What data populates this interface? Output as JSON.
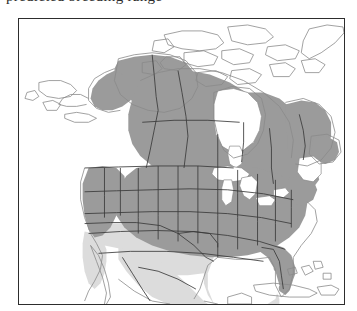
{
  "figure": {
    "title_partial": "predicted breeding range",
    "frame_color": "#2d2d2d",
    "background": "#ffffff"
  },
  "map": {
    "name": "north-america-distribution-map",
    "projection_hint": "lambert-conformal-conic",
    "outline_color": "#8a8a8a",
    "border_color": "#3a3a3a",
    "water_color": "#ffffff",
    "regions": [
      {
        "id": "high-suitability",
        "label": "dark shaded range",
        "color": "#9b9b9b"
      },
      {
        "id": "low-suitability",
        "label": "light shaded range",
        "color": "#dcdcdc"
      },
      {
        "id": "outside-range",
        "label": "unshaded",
        "color": "#ffffff"
      }
    ],
    "shaded_areas": [
      "eastern Alaska",
      "Yukon",
      "Northwest Territories (south)",
      "British Columbia",
      "Alberta",
      "Saskatchewan",
      "Manitoba",
      "Ontario",
      "Quebec",
      "Labrador",
      "Newfoundland",
      "Maritime provinces",
      "continental United States"
    ],
    "light_shaded_areas": [
      "southern California",
      "Arizona",
      "New Mexico",
      "southern Texas",
      "northern Mexico",
      "Baja California"
    ],
    "unshaded_areas": [
      "western Alaska",
      "Canadian Arctic Archipelago",
      "Greenland",
      "Hudson Bay",
      "Great Lakes",
      "Gulf of St. Lawrence",
      "Cuba",
      "Hispaniola",
      "Bahamas",
      "southern Mexico"
    ]
  }
}
